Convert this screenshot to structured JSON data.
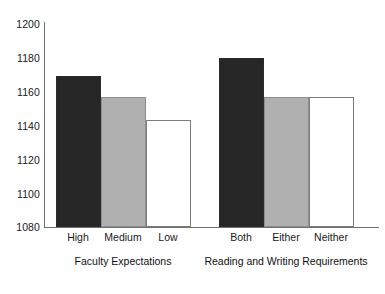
{
  "chart_data": {
    "type": "bar",
    "title": "",
    "subtitle": "",
    "xlabel": "",
    "ylabel": "",
    "ylim": [
      1080,
      1200
    ],
    "yticks": [
      1080,
      1100,
      1120,
      1140,
      1160,
      1180,
      1200
    ],
    "ytick_labels": [
      "1080",
      "1100",
      "1120",
      "1140",
      "1160",
      "1180",
      "1200"
    ],
    "grid": false,
    "legend_position": "none",
    "categories": [
      "High",
      "Medium",
      "Low",
      "Both",
      "Either",
      "Neither"
    ],
    "values": [
      1169,
      1157,
      1143,
      1180,
      1157,
      1157
    ],
    "bar_styles": [
      "dark",
      "grey",
      "white",
      "dark",
      "grey",
      "white"
    ],
    "groups": [
      {
        "label": "Faculty Expectations",
        "categories": [
          "High",
          "Medium",
          "Low"
        ],
        "values": [
          1169,
          1157,
          1143
        ]
      },
      {
        "label": "Reading and Writing Requirements",
        "categories": [
          "Both",
          "Either",
          "Neither"
        ],
        "values": [
          1180,
          1157,
          1157
        ]
      }
    ],
    "colors": {
      "dark": "#262626",
      "grey": "#b0b0b0",
      "white": "#ffffff",
      "axis": "#6f6f6f",
      "text": "#1a1a1a"
    }
  },
  "axis": {
    "ticks": [
      "1200",
      "1180",
      "1160",
      "1140",
      "1120",
      "1100",
      "1080"
    ]
  },
  "bars": [
    {
      "label": "High",
      "value": 1169,
      "style": "dark"
    },
    {
      "label": "Medium",
      "value": 1157,
      "style": "grey"
    },
    {
      "label": "Low",
      "value": 1143,
      "style": "white"
    },
    {
      "label": "Both",
      "value": 1180,
      "style": "dark"
    },
    {
      "label": "Either",
      "value": 1157,
      "style": "grey"
    },
    {
      "label": "Neither",
      "value": 1157,
      "style": "white"
    }
  ],
  "group_labels": {
    "left": "Faculty Expectations",
    "right": "Reading and Writing Requirements"
  },
  "caption_sliver": "partial text cropped at page bottom"
}
